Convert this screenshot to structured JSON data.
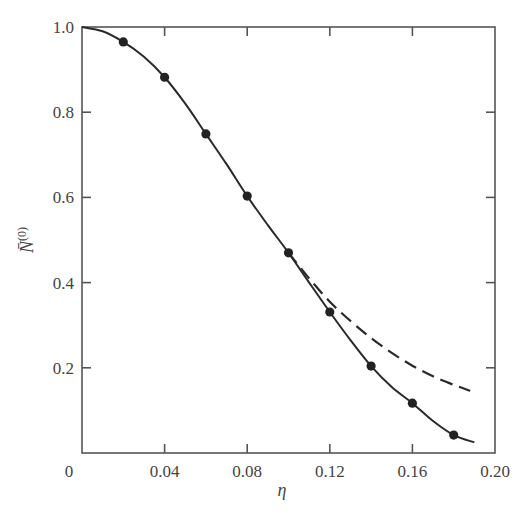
{
  "chart_data": {
    "type": "line",
    "title": "",
    "xlabel": "η",
    "ylabel": "N̄⁽⁰⁾",
    "ylabel_base": "N̄",
    "ylabel_sup": "(0)",
    "xlim": [
      0,
      0.2
    ],
    "ylim": [
      0,
      1.0
    ],
    "grid": false,
    "legend": null,
    "x_ticks": [
      0.04,
      0.08,
      0.12,
      0.16
    ],
    "x_tick_labels": [
      "0",
      "0.04",
      "0.08",
      "0.12",
      "0.16",
      "0.20"
    ],
    "y_tick_labels": [
      "0.2",
      "0.4",
      "0.6",
      "0.8",
      "1.0"
    ],
    "y_ticks": [
      0.2,
      0.4,
      0.6,
      0.8
    ],
    "series": [
      {
        "name": "exact (solid curve)",
        "style": "solid",
        "x": [
          0,
          0.01,
          0.02,
          0.03,
          0.04,
          0.05,
          0.06,
          0.07,
          0.08,
          0.09,
          0.1,
          0.11,
          0.12,
          0.13,
          0.14,
          0.15,
          0.16,
          0.17,
          0.18,
          0.19
        ],
        "y": [
          1.0,
          0.99,
          0.965,
          0.93,
          0.882,
          0.82,
          0.749,
          0.678,
          0.603,
          0.535,
          0.47,
          0.4,
          0.331,
          0.265,
          0.204,
          0.155,
          0.117,
          0.075,
          0.042,
          0.025
        ]
      },
      {
        "name": "data points",
        "style": "markers",
        "x": [
          0.02,
          0.04,
          0.06,
          0.08,
          0.1,
          0.12,
          0.14,
          0.16,
          0.18
        ],
        "y": [
          0.965,
          0.882,
          0.749,
          0.603,
          0.47,
          0.331,
          0.204,
          0.117,
          0.042
        ]
      },
      {
        "name": "approximation (dashed curve)",
        "style": "dashed",
        "x": [
          0.1,
          0.11,
          0.12,
          0.13,
          0.14,
          0.15,
          0.16,
          0.17,
          0.18,
          0.188
        ],
        "y": [
          0.47,
          0.41,
          0.355,
          0.31,
          0.27,
          0.235,
          0.205,
          0.18,
          0.16,
          0.146
        ]
      }
    ]
  }
}
